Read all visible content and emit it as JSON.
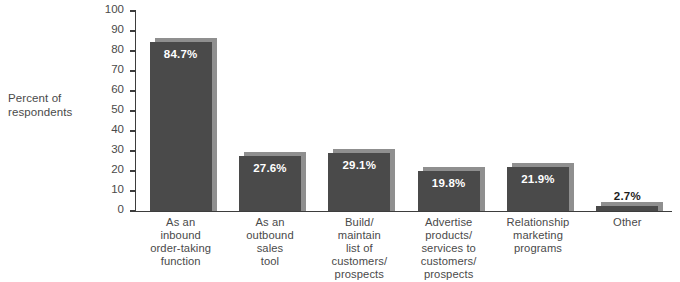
{
  "chart_data": {
    "type": "bar",
    "title": "",
    "subtitle": "",
    "xlabel": "",
    "ylabel": "Percent of respondents",
    "ylim": [
      0,
      100
    ],
    "yticks": [
      0,
      10,
      20,
      30,
      40,
      50,
      60,
      70,
      80,
      90,
      100
    ],
    "ytick_labels": [
      "0",
      "10",
      "20",
      "30",
      "40",
      "50",
      "60",
      "70",
      "80",
      "90",
      "100"
    ],
    "grid": false,
    "legend": null,
    "categories": [
      "As an inbound order-taking function",
      "As an outbound sales tool",
      "Build/ maintain list of customers/ prospects",
      "Advertise products/ services to customers/ prospects",
      "Relationship marketing programs",
      "Other"
    ],
    "category_lines": [
      [
        "As an",
        "inbound",
        "order-taking",
        "function"
      ],
      [
        "As an",
        "outbound",
        "sales",
        "tool"
      ],
      [
        "Build/",
        "maintain",
        "list of",
        "customers/",
        "prospects"
      ],
      [
        "Advertise",
        "products/",
        "services to",
        "customers/",
        "prospects"
      ],
      [
        "Relationship",
        "marketing",
        "programs"
      ],
      [
        "Other"
      ]
    ],
    "values": [
      84.7,
      27.6,
      29.1,
      19.8,
      21.9,
      2.7
    ],
    "value_labels": [
      "84.7%",
      "27.6%",
      "29.1%",
      "19.8%",
      "21.9%",
      "2.7%"
    ],
    "label_placement": [
      "inside",
      "inside",
      "inside",
      "inside",
      "inside",
      "outside"
    ],
    "colors": {
      "bar": "#4a4a4a",
      "bar_shadow": "#8f8f8f",
      "axis": "#3d3d3d",
      "text": "#4a4a4a",
      "value_inside": "#ffffff",
      "value_outside": "#1c1c1c",
      "background": "#ffffff"
    }
  },
  "axis": {
    "y_title_line1": "Percent of",
    "y_title_line2": "respondents"
  },
  "caption": {
    "cropped_top_text": ""
  }
}
